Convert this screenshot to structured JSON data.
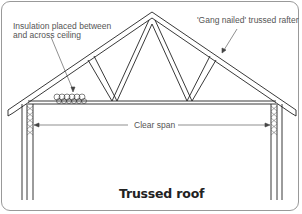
{
  "diagram": {
    "title": "Trussed roof",
    "labels": {
      "insulation_line1": "Insulation placed between",
      "insulation_line2": "and across ceiling",
      "rafter": "'Gang nailed' trussed rafter",
      "span": "Clear span"
    },
    "colors": {
      "line": "#222222",
      "border": "#999999",
      "text": "#555555"
    }
  }
}
